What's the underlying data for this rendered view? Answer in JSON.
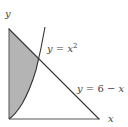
{
  "diagram": {
    "axes": {
      "x_label": "x",
      "y_label": "y"
    },
    "curves": [
      {
        "name": "parabola",
        "equation_lhs": "y = x",
        "superscript": "2",
        "label": "y = x²"
      },
      {
        "name": "line",
        "label": "y = 6 − x"
      }
    ],
    "shaded_region": {
      "description": "Region bounded by y-axis, y = x² and y = 6 − x",
      "fill": "#b4b4b4"
    },
    "colors": {
      "stroke": "#333333",
      "shade": "#b4b4b4",
      "axis": "#555555"
    }
  }
}
